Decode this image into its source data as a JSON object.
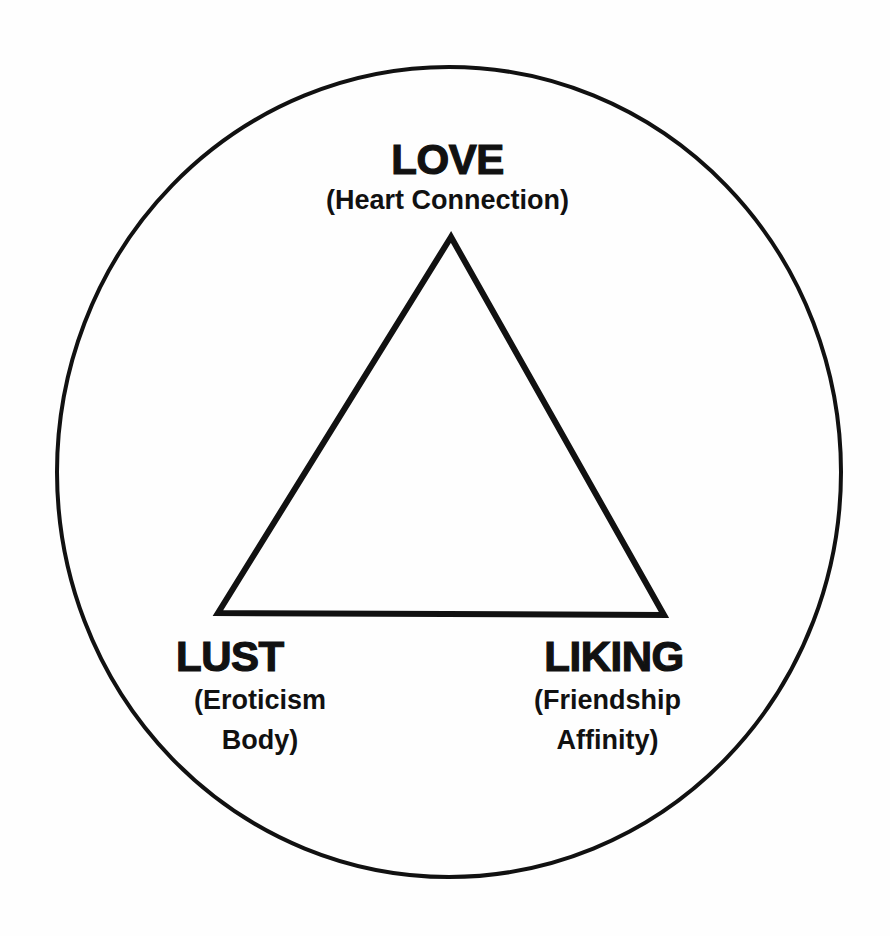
{
  "diagram": {
    "type": "triangle-in-circle",
    "colors": {
      "background": "#fefefe",
      "stroke": "#111111",
      "text": "#111111"
    },
    "circle": {
      "cx": 449,
      "cy": 472,
      "rx": 392,
      "ry": 405,
      "stroke_width": 4
    },
    "triangle": {
      "points": "451,237 218,613 664,615",
      "stroke_width": 6
    },
    "vertices": {
      "top": {
        "title": "LOVE",
        "subtitle_lines": [
          "(Heart Connection)"
        ]
      },
      "bottom_left": {
        "title": "LUST",
        "subtitle_lines": [
          "(Eroticism",
          "Body)"
        ]
      },
      "bottom_right": {
        "title": "LIKING",
        "subtitle_lines": [
          "(Friendship",
          "Affinity)"
        ]
      }
    }
  }
}
